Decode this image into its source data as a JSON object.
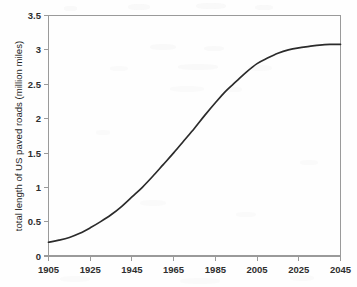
{
  "chart_data": {
    "type": "line",
    "title": "",
    "subtitle": "",
    "xlabel": "",
    "ylabel": "total length of US paved roads (million miles)",
    "xlim": [
      1905,
      2045
    ],
    "ylim": [
      0,
      3.5
    ],
    "grid": false,
    "legend": null,
    "x_ticks": [
      "1905",
      "1925",
      "1945",
      "1965",
      "1985",
      "2005",
      "2025",
      "2045"
    ],
    "x_tick_values": [
      1905,
      1925,
      1945,
      1965,
      1985,
      2005,
      2025,
      2045
    ],
    "y_ticks": [
      "0",
      "0.5",
      "1",
      "1.5",
      "2",
      "2.5",
      "3",
      "3.5"
    ],
    "y_tick_values": [
      0,
      0.5,
      1,
      1.5,
      2,
      2.5,
      3,
      3.5
    ],
    "series": [
      {
        "name": "total length of US paved roads",
        "x": [
          1905,
          1910,
          1915,
          1920,
          1925,
          1930,
          1935,
          1940,
          1945,
          1950,
          1955,
          1960,
          1965,
          1970,
          1975,
          1980,
          1985,
          1990,
          1995,
          2000,
          2005,
          2010,
          2015,
          2020,
          2025,
          2030,
          2035,
          2040,
          2045
        ],
        "values": [
          0.2,
          0.23,
          0.27,
          0.33,
          0.41,
          0.5,
          0.6,
          0.72,
          0.86,
          1.0,
          1.16,
          1.33,
          1.5,
          1.68,
          1.86,
          2.05,
          2.23,
          2.4,
          2.54,
          2.68,
          2.8,
          2.88,
          2.95,
          3.0,
          3.03,
          3.05,
          3.07,
          3.08,
          3.08
        ]
      }
    ],
    "color": "#2b2b2b"
  },
  "axes": {
    "y_axis_title": "total length of US paved roads (million miles)",
    "x_axis_title": ""
  },
  "style": {
    "axis_color": "#9a9a9a",
    "curve_color": "#2b2b2b",
    "label_color": "#2e2e2e",
    "background": "#ffffff"
  }
}
